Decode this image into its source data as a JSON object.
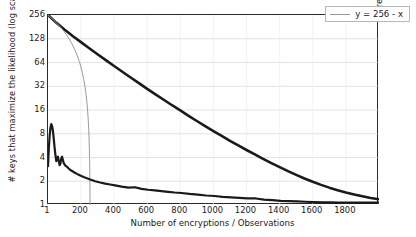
{
  "chart_data": {
    "type": "line",
    "title": "",
    "xlabel": "Number of encryptions / Observations",
    "ylabel_left": "# keys that maximize the likelihood (log scale)",
    "ylabel_right": "# remaining keys (log scale)",
    "xlim": [
      1,
      2000
    ],
    "ylim": [
      1,
      256
    ],
    "yscale": "log2",
    "xscale": "linear",
    "grid": true,
    "grid_axis": "y",
    "legend_position": "top-right",
    "xticks": [
      1,
      200,
      400,
      600,
      800,
      1000,
      1200,
      1400,
      1600,
      1800
    ],
    "xtick_labels": [
      "1",
      "200",
      "400",
      "600",
      "800",
      "1000",
      "1200",
      "1400",
      "1600",
      "1800"
    ],
    "yticks": [
      1,
      2,
      4,
      8,
      16,
      32,
      64,
      128,
      256
    ],
    "ytick_labels": [
      "1",
      "2",
      "4",
      "8",
      "16",
      "32",
      "64",
      "128",
      "256"
    ],
    "series": [
      {
        "name": "remaining-keys",
        "legend": "",
        "color": "#1a1a1a",
        "width": 2.6,
        "x": [
          1,
          50,
          100,
          150,
          200,
          250,
          300,
          350,
          400,
          450,
          500,
          550,
          600,
          650,
          700,
          750,
          800,
          850,
          900,
          950,
          1000,
          1050,
          1100,
          1150,
          1200,
          1250,
          1300,
          1350,
          1400,
          1450,
          1500,
          1550,
          1600,
          1650,
          1700,
          1750,
          1800,
          1850,
          1900,
          1950,
          2000
        ],
        "y": [
          256,
          205,
          168,
          139,
          116,
          97,
          81.5,
          68.5,
          57.8,
          48.8,
          41.3,
          35.0,
          29.7,
          25.3,
          21.6,
          18.4,
          15.8,
          13.5,
          11.6,
          10.0,
          8.65,
          7.5,
          6.52,
          5.69,
          4.98,
          4.37,
          3.85,
          3.4,
          3.02,
          2.69,
          2.41,
          2.17,
          1.97,
          1.8,
          1.66,
          1.54,
          1.44,
          1.36,
          1.29,
          1.23,
          1.18
        ]
      },
      {
        "name": "y-256-minus-x",
        "legend": "y = 256 - x",
        "color": "#9a9a9a",
        "width": 1.0,
        "x": [
          1,
          16,
          32,
          48,
          64,
          80,
          96,
          112,
          128,
          144,
          160,
          176,
          192,
          200,
          208,
          216,
          224,
          230,
          236,
          240,
          244,
          247,
          249,
          251,
          252,
          253,
          254,
          255
        ],
        "y": [
          255,
          240,
          224,
          208,
          192,
          176,
          160,
          144,
          128,
          112,
          96,
          80,
          64,
          56,
          48,
          40,
          32,
          26,
          20,
          16,
          12,
          9,
          7,
          5,
          4,
          3,
          2,
          1
        ]
      },
      {
        "name": "max-likelihood-keys",
        "legend": "",
        "color": "#1a1a1a",
        "width": 2.2,
        "x": [
          1,
          6,
          11,
          16,
          21,
          26,
          31,
          36,
          41,
          46,
          51,
          56,
          61,
          66,
          71,
          76,
          81,
          86,
          91,
          96,
          106,
          116,
          126,
          136,
          146,
          156,
          166,
          176,
          186,
          196,
          216,
          236,
          256,
          286,
          316,
          346,
          376,
          406,
          446,
          486,
          526,
          566,
          606,
          646,
          686,
          726,
          766,
          806,
          856,
          906,
          956,
          1006,
          1056,
          1106,
          1156,
          1206,
          1256,
          1306,
          1356,
          1406,
          1456,
          1506,
          1556,
          1606,
          1656,
          1706,
          1756,
          1806,
          1856,
          1906,
          1956,
          2000
        ],
        "y": [
          3.1,
          5.2,
          7.6,
          9.6,
          10.6,
          10.0,
          8.6,
          6.8,
          5.3,
          4.3,
          3.6,
          3.9,
          4.1,
          3.6,
          3.2,
          3.35,
          3.9,
          4.1,
          3.7,
          3.4,
          3.15,
          3.05,
          2.9,
          2.78,
          2.7,
          2.62,
          2.55,
          2.48,
          2.42,
          2.36,
          2.26,
          2.18,
          2.1,
          2.0,
          1.93,
          1.87,
          1.82,
          1.77,
          1.71,
          1.66,
          1.68,
          1.6,
          1.56,
          1.53,
          1.5,
          1.47,
          1.44,
          1.42,
          1.38,
          1.35,
          1.32,
          1.3,
          1.27,
          1.25,
          1.23,
          1.21,
          1.21,
          1.17,
          1.15,
          1.13,
          1.12,
          1.11,
          1.1,
          1.09,
          1.08,
          1.08,
          1.07,
          1.07,
          1.07,
          1.07,
          1.07,
          1.07
        ]
      }
    ]
  },
  "legend": {
    "entry_label": "y = 256 - x"
  },
  "axes": {
    "x_title": "Number of encryptions / Observations",
    "y_left_title": "# keys that maximize the likelihood (log scale)",
    "y_right_title": "# remaining keys (log scale)"
  }
}
